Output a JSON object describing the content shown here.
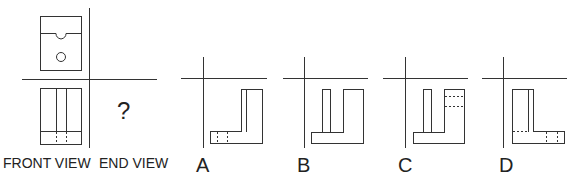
{
  "problem": {
    "type": "orthographic-projection",
    "question_mark": "?",
    "given_views": {
      "top_view_label": "",
      "front_view_label": "FRONT VIEW",
      "end_view_label": "END VIEW"
    },
    "options": [
      {
        "label": "A"
      },
      {
        "label": "B"
      },
      {
        "label": "C"
      },
      {
        "label": "D"
      }
    ]
  },
  "colors": {
    "line": "#333333",
    "background": "#ffffff"
  }
}
